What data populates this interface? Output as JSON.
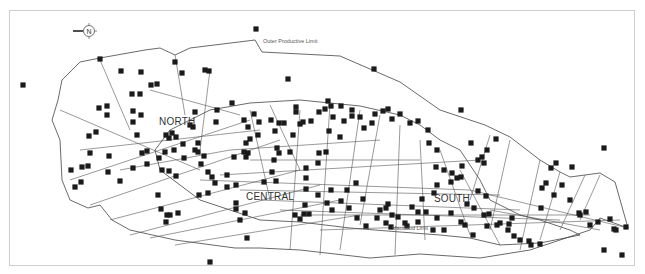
{
  "map": {
    "compass": {
      "symbol": "N",
      "arrow_direction": "left"
    },
    "labels": {
      "outer_limit": "Outer Productive Limit",
      "mauddud_limit": "Mauddud Limit",
      "north": "NORTH",
      "central": "CENTRAL",
      "south": "SOUTH"
    },
    "colors": {
      "well": "#1a1a1a",
      "outline": "#444444",
      "frame": "#cfcfcf"
    },
    "wells": [
      [
        256,
        29
      ],
      [
        23,
        85
      ],
      [
        100,
        59
      ],
      [
        175,
        62
      ],
      [
        121,
        71
      ],
      [
        141,
        72
      ],
      [
        182,
        73
      ],
      [
        205,
        70
      ],
      [
        209,
        71
      ],
      [
        288,
        79
      ],
      [
        374,
        69
      ],
      [
        461,
        110
      ],
      [
        604,
        148
      ],
      [
        157,
        84
      ],
      [
        151,
        85
      ],
      [
        132,
        94
      ],
      [
        140,
        94
      ],
      [
        99,
        108
      ],
      [
        107,
        106
      ],
      [
        107,
        115
      ],
      [
        96,
        132
      ],
      [
        89,
        136
      ],
      [
        133,
        122
      ],
      [
        141,
        115
      ],
      [
        137,
        135
      ],
      [
        142,
        153
      ],
      [
        133,
        168
      ],
      [
        120,
        181
      ],
      [
        109,
        156
      ],
      [
        108,
        172
      ],
      [
        90,
        153
      ],
      [
        88,
        166
      ],
      [
        82,
        167
      ],
      [
        71,
        170
      ],
      [
        81,
        182
      ],
      [
        75,
        187
      ],
      [
        133,
        111
      ],
      [
        166,
        135
      ],
      [
        172,
        133
      ],
      [
        169,
        138
      ],
      [
        165,
        152
      ],
      [
        147,
        151
      ],
      [
        147,
        164
      ],
      [
        159,
        158
      ],
      [
        162,
        170
      ],
      [
        169,
        171
      ],
      [
        176,
        176
      ],
      [
        184,
        158
      ],
      [
        195,
        150
      ],
      [
        198,
        152
      ],
      [
        198,
        143
      ],
      [
        193,
        127
      ],
      [
        195,
        112
      ],
      [
        201,
        164
      ],
      [
        204,
        156
      ],
      [
        208,
        172
      ],
      [
        199,
        195
      ],
      [
        208,
        193
      ],
      [
        215,
        183
      ],
      [
        212,
        177
      ],
      [
        216,
        122
      ],
      [
        217,
        110
      ],
      [
        232,
        103
      ],
      [
        244,
        120
      ],
      [
        248,
        127
      ],
      [
        250,
        139
      ],
      [
        258,
        135
      ],
      [
        259,
        122
      ],
      [
        254,
        114
      ],
      [
        246,
        143
      ],
      [
        248,
        153
      ],
      [
        244,
        152
      ],
      [
        246,
        157
      ],
      [
        234,
        157
      ],
      [
        227,
        175
      ],
      [
        227,
        187
      ],
      [
        236,
        185
      ],
      [
        236,
        203
      ],
      [
        236,
        209
      ],
      [
        245,
        213
      ],
      [
        240,
        220
      ],
      [
        247,
        238
      ],
      [
        210,
        262
      ],
      [
        271,
        120
      ],
      [
        279,
        123
      ],
      [
        284,
        123
      ],
      [
        275,
        131
      ],
      [
        277,
        148
      ],
      [
        279,
        153
      ],
      [
        274,
        160
      ],
      [
        272,
        172
      ],
      [
        264,
        182
      ],
      [
        276,
        181
      ],
      [
        290,
        152
      ],
      [
        293,
        135
      ],
      [
        303,
        122
      ],
      [
        296,
        112
      ],
      [
        296,
        107
      ],
      [
        300,
        124
      ],
      [
        311,
        121
      ],
      [
        319,
        112
      ],
      [
        328,
        101
      ],
      [
        331,
        106
      ],
      [
        325,
        109
      ],
      [
        341,
        106
      ],
      [
        352,
        110
      ],
      [
        344,
        121
      ],
      [
        333,
        117
      ],
      [
        329,
        131
      ],
      [
        340,
        137
      ],
      [
        326,
        152
      ],
      [
        319,
        153
      ],
      [
        318,
        163
      ],
      [
        306,
        168
      ],
      [
        306,
        178
      ],
      [
        306,
        189
      ],
      [
        305,
        205
      ],
      [
        309,
        214
      ],
      [
        304,
        214
      ],
      [
        300,
        219
      ],
      [
        295,
        215
      ],
      [
        318,
        195
      ],
      [
        327,
        203
      ],
      [
        332,
        210
      ],
      [
        331,
        190
      ],
      [
        341,
        201
      ],
      [
        349,
        208
      ],
      [
        357,
        218
      ],
      [
        363,
        199
      ],
      [
        356,
        183
      ],
      [
        347,
        190
      ],
      [
        352,
        116
      ],
      [
        360,
        117
      ],
      [
        364,
        128
      ],
      [
        372,
        123
      ],
      [
        375,
        114
      ],
      [
        383,
        111
      ],
      [
        388,
        109
      ],
      [
        392,
        119
      ],
      [
        400,
        114
      ],
      [
        410,
        123
      ],
      [
        418,
        121
      ],
      [
        428,
        130
      ],
      [
        429,
        143
      ],
      [
        437,
        150
      ],
      [
        436,
        167
      ],
      [
        444,
        170
      ],
      [
        452,
        173
      ],
      [
        471,
        143
      ],
      [
        478,
        160
      ],
      [
        484,
        163
      ],
      [
        496,
        139
      ],
      [
        487,
        150
      ],
      [
        482,
        157
      ],
      [
        462,
        166
      ],
      [
        457,
        178
      ],
      [
        451,
        182
      ],
      [
        437,
        185
      ],
      [
        434,
        193
      ],
      [
        422,
        199
      ],
      [
        412,
        207
      ],
      [
        418,
        212
      ],
      [
        426,
        212
      ],
      [
        437,
        218
      ],
      [
        405,
        223
      ],
      [
        391,
        227
      ],
      [
        386,
        223
      ],
      [
        377,
        218
      ],
      [
        366,
        226
      ],
      [
        380,
        210
      ],
      [
        386,
        208
      ],
      [
        388,
        204
      ],
      [
        392,
        215
      ],
      [
        398,
        217
      ],
      [
        407,
        226
      ],
      [
        418,
        222
      ],
      [
        433,
        230
      ],
      [
        444,
        230
      ],
      [
        465,
        225
      ],
      [
        467,
        204
      ],
      [
        474,
        208
      ],
      [
        484,
        215
      ],
      [
        451,
        213
      ],
      [
        461,
        222
      ],
      [
        473,
        235
      ],
      [
        487,
        226
      ],
      [
        497,
        225
      ],
      [
        508,
        230
      ],
      [
        520,
        240
      ],
      [
        529,
        241
      ],
      [
        540,
        244
      ],
      [
        531,
        245
      ],
      [
        514,
        236
      ],
      [
        509,
        224
      ],
      [
        512,
        218
      ],
      [
        500,
        223
      ],
      [
        489,
        214
      ],
      [
        486,
        196
      ],
      [
        478,
        191
      ],
      [
        461,
        177
      ],
      [
        542,
        188
      ],
      [
        554,
        195
      ],
      [
        562,
        185
      ],
      [
        570,
        200
      ],
      [
        579,
        213
      ],
      [
        572,
        167
      ],
      [
        556,
        163
      ],
      [
        551,
        168
      ],
      [
        546,
        183
      ],
      [
        541,
        208
      ],
      [
        580,
        215
      ],
      [
        586,
        212
      ],
      [
        590,
        225
      ],
      [
        598,
        222
      ],
      [
        610,
        219
      ],
      [
        614,
        229
      ],
      [
        616,
        230
      ],
      [
        626,
        227
      ],
      [
        622,
        255
      ],
      [
        604,
        250
      ],
      [
        176,
        137
      ],
      [
        183,
        144
      ],
      [
        190,
        125
      ],
      [
        174,
        150
      ],
      [
        158,
        195
      ],
      [
        161,
        209
      ],
      [
        166,
        222
      ],
      [
        167,
        215
      ],
      [
        178,
        213
      ],
      [
        170,
        215
      ]
    ]
  }
}
